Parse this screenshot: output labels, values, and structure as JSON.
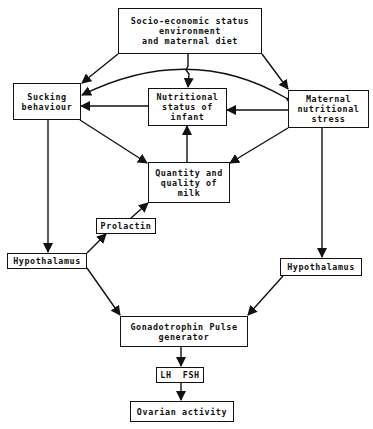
{
  "diagram": {
    "nodes": {
      "socio": {
        "label": "Socio-economic status\nenvironment\nand maternal diet"
      },
      "sucking": {
        "label": "Sucking\nbehaviour"
      },
      "infant": {
        "label": "Nutritional\nstatus of\ninfant"
      },
      "maternal": {
        "label": "Maternal\nnutritional\nstress"
      },
      "milk": {
        "label": "Quantity and\nquality of\nmilk"
      },
      "prolactin": {
        "label": "Prolactin"
      },
      "hypo_left": {
        "label": "Hypothalamus"
      },
      "hypo_right": {
        "label": "Hypothalamus"
      },
      "gonado": {
        "label": "Gonadotrophin Pulse\ngenerator"
      },
      "lhfsh": {
        "label": "LH  FSH"
      },
      "ovarian": {
        "label": "Ovarian activity"
      }
    },
    "edges": [
      {
        "from": "socio",
        "to": "sucking"
      },
      {
        "from": "socio",
        "to": "infant"
      },
      {
        "from": "socio",
        "to": "maternal"
      },
      {
        "from": "maternal",
        "to": "sucking",
        "style": "curved-arc"
      },
      {
        "from": "sucking",
        "to": "maternal",
        "style": "curved-arc"
      },
      {
        "from": "infant",
        "to": "sucking"
      },
      {
        "from": "maternal",
        "to": "infant"
      },
      {
        "from": "sucking",
        "to": "milk"
      },
      {
        "from": "maternal",
        "to": "milk"
      },
      {
        "from": "milk",
        "to": "infant"
      },
      {
        "from": "sucking",
        "to": "hypo_left"
      },
      {
        "from": "hypo_left",
        "to": "prolactin"
      },
      {
        "from": "prolactin",
        "to": "milk"
      },
      {
        "from": "maternal",
        "to": "hypo_right"
      },
      {
        "from": "hypo_left",
        "to": "gonado"
      },
      {
        "from": "hypo_right",
        "to": "gonado"
      },
      {
        "from": "gonado",
        "to": "lhfsh"
      },
      {
        "from": "lhfsh",
        "to": "ovarian"
      }
    ]
  }
}
